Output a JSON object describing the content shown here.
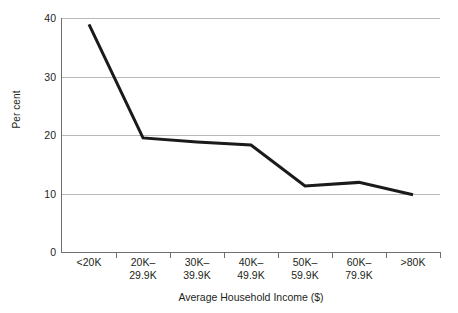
{
  "chart_data": {
    "type": "line",
    "title": "",
    "xlabel": "Average Household Income ($)",
    "ylabel": "Per cent",
    "categories": [
      "<20K",
      "20K–\n29.9K",
      "30K–\n39.9K",
      "40K–\n49.9K",
      "50K–\n59.9K",
      "60K–\n79.9K",
      ">80K"
    ],
    "category_lines": [
      [
        "<20K",
        ""
      ],
      [
        "20K–",
        "29.9K"
      ],
      [
        "30K–",
        "39.9K"
      ],
      [
        "40K–",
        "49.9K"
      ],
      [
        "50K–",
        "59.9K"
      ],
      [
        "60K–",
        "79.9K"
      ],
      [
        ">80K",
        ""
      ]
    ],
    "values": [
      38.9,
      19.5,
      18.8,
      18.3,
      11.3,
      11.9,
      9.8
    ],
    "ylim": [
      0,
      40
    ],
    "yticks": [
      0,
      10,
      20,
      30,
      40
    ],
    "ytick_labels": [
      "0",
      "10",
      "20",
      "30",
      "40"
    ],
    "grid": true,
    "grid_axis": "y",
    "legend": false,
    "legend_position": "none",
    "series_color": "#1a1a1a",
    "gridline_color": "#b8b8b8",
    "axis_color": "#6f6f6f",
    "background_color": "#ffffff",
    "line_width": 3
  }
}
